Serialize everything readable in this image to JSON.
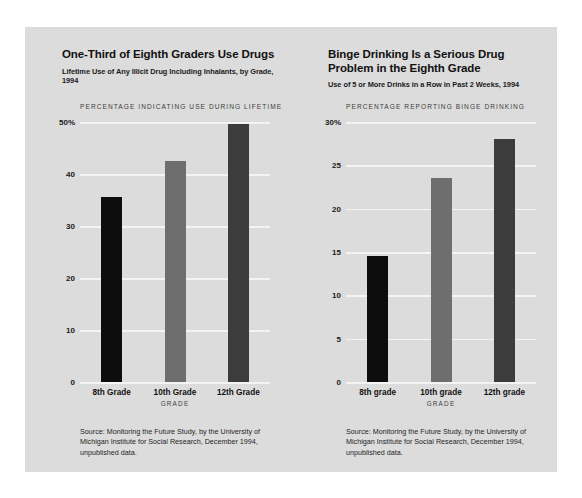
{
  "page": {
    "background": "#ffffff",
    "panel_color": "#dcdcdc"
  },
  "chart_data": [
    {
      "type": "bar",
      "id": "drug-use",
      "title": "One-Third of Eighth Graders Use Drugs",
      "subtitle": "Lifetime Use of Any Illicit Drug Including Inhalants, by Grade, 1994",
      "axis_caption": "PERCENTAGE INDICATING USE DURING LIFETIME",
      "categories": [
        "8th Grade",
        "10th Grade",
        "12th Grade"
      ],
      "values": [
        35.5,
        42.5,
        49.7
      ],
      "bar_colors": [
        "#0d0d0d",
        "#6e6e6e",
        "#3c3c3c"
      ],
      "xlabel": "GRADE",
      "ylabel": "",
      "ylim": [
        0,
        50
      ],
      "yticks": [
        50,
        40,
        30,
        20,
        10,
        0
      ],
      "ytick_labels": [
        "50%",
        "40",
        "30",
        "20",
        "10",
        "0"
      ],
      "grid": true,
      "legend": "none",
      "source": "Source: Monitoring the Future Study, by the University of Michigan Institute for Social Research, December 1994, unpublished data."
    },
    {
      "type": "bar",
      "id": "binge-drinking",
      "title": "Binge Drinking Is a Serious Drug Problem in the Eighth Grade",
      "subtitle": "Use of 5 or More Drinks in a Row in Past 2 Weeks, 1994",
      "axis_caption": "PERCENTAGE REPORTING BINGE DRINKING",
      "categories": [
        "8th grade",
        "10th grade",
        "12th grade"
      ],
      "values": [
        14.5,
        23.5,
        28.0
      ],
      "bar_colors": [
        "#0d0d0d",
        "#6e6e6e",
        "#3c3c3c"
      ],
      "xlabel": "GRADE",
      "ylabel": "",
      "ylim": [
        0,
        30
      ],
      "yticks": [
        30,
        25,
        20,
        15,
        10,
        5,
        0
      ],
      "ytick_labels": [
        "30%",
        "25",
        "20",
        "15",
        "10",
        "5",
        "0"
      ],
      "grid": true,
      "legend": "none",
      "source": "Source: Monitoring the Future Study, by the University of Michigan Institute for Social Research, December 1994, unpublished data."
    }
  ]
}
